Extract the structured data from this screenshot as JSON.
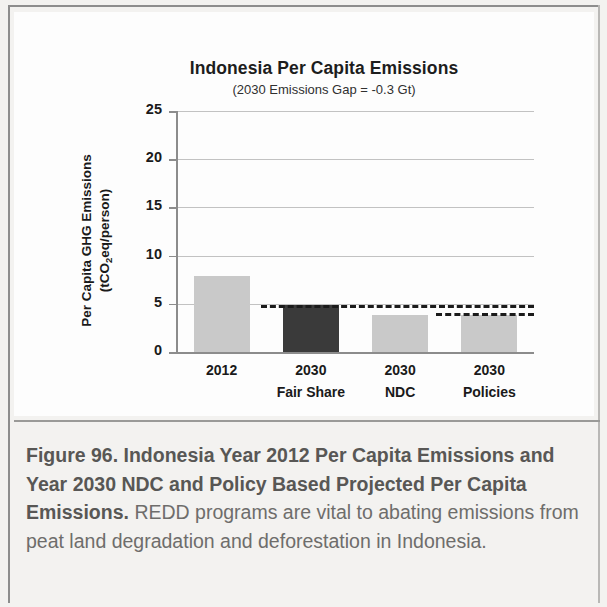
{
  "figure": {
    "caption_bold": "Figure 96. Indonesia Year 2012 Per Capita Emissions and Year 2030 NDC and Policy Based Projected Per Capita Emissions.",
    "caption_rest": " REDD programs are vital to abating emissions from peat land degradation and deforestation in Indonesia."
  },
  "colors": {
    "bar_light": "#c9c9c9",
    "bar_dark": "#3a3a3a",
    "gridline": "#c2c2c2",
    "axis": "#8c8c8c",
    "dash": "#1b1b1b",
    "panel_bg": "#fdfdfd",
    "page_bg": "#f3f2f0",
    "caption_text": "#6e6d6b"
  },
  "chart_data": {
    "type": "bar",
    "title": "Indonesia Per Capita Emissions",
    "subtitle": "(2030 Emissions Gap  = -0.3 Gt)",
    "xlabel": "",
    "ylabel_line1": "Per Capita GHG Emissions",
    "ylabel_line2_pre": "(tCO",
    "ylabel_line2_sub": "2",
    "ylabel_line2_post": "eq/person)",
    "ylim": [
      0,
      25
    ],
    "yticks": [
      25,
      20,
      15,
      10,
      5,
      0
    ],
    "ytick_labels": [
      "25",
      "20",
      "15",
      "10",
      "5",
      "0"
    ],
    "grid": true,
    "legend": "none",
    "categories": [
      "2012",
      "2030 Fair Share",
      "2030 NDC",
      "2030 Policies"
    ],
    "category_lines": [
      [
        "2012",
        ""
      ],
      [
        "2030",
        "Fair Share"
      ],
      [
        "2030",
        "NDC"
      ],
      [
        "2030",
        "Policies"
      ]
    ],
    "values": [
      7.9,
      4.85,
      3.85,
      3.85
    ],
    "bar_colors": [
      "#c9c9c9",
      "#3a3a3a",
      "#c9c9c9",
      "#c9c9c9"
    ],
    "reference_lines": [
      {
        "name": "fair-share-level",
        "value": 4.85,
        "x_start_pct": 23.5,
        "x_end_pct": 100
      },
      {
        "name": "policies-level",
        "value": 4.0,
        "x_start_pct": 72.5,
        "x_end_pct": 100
      }
    ]
  }
}
